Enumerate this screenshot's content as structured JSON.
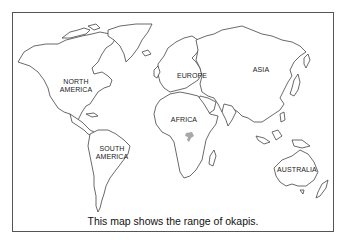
{
  "map": {
    "title": "World map",
    "caption": "This map shows the range of okapis.",
    "labels": {
      "north_america_1": "NORTH",
      "north_america_2": "AMERICA",
      "south_america_1": "SOUTH",
      "south_america_2": "AMERICA",
      "europe": "EUROPE",
      "asia": "ASIA",
      "africa": "AFRICA",
      "australia": "AUSTRALIA"
    },
    "highlight": {
      "name": "okapi range",
      "region": "Central Africa",
      "color": "#a8a8a8"
    },
    "colors": {
      "outline": "#444444",
      "land": "#ffffff",
      "frame": "#555555"
    }
  }
}
